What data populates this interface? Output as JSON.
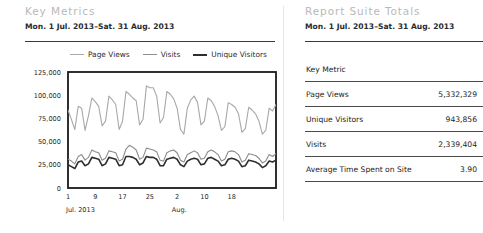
{
  "left_panel": {
    "title": "Key Metrics",
    "subtitle": "Mon. 1 Jul. 2013–Sat. 31 Aug. 2013"
  },
  "right_panel": {
    "title": "Report Suite Totals",
    "subtitle": "Mon. 1 Jul. 2013–Sat. 31 Aug. 2013",
    "table": {
      "columns": [
        "Key Metric",
        ""
      ],
      "rows": [
        {
          "metric": "Page Views",
          "value": "5,332,329"
        },
        {
          "metric": "Unique Visitors",
          "value": "943,856"
        },
        {
          "metric": "Visits",
          "value": "2,339,404"
        },
        {
          "metric": "Average Time Spent on Site",
          "value": "3.90"
        }
      ]
    }
  },
  "legend": {
    "items": [
      {
        "label": "Page Views",
        "color": "#a8a8a8"
      },
      {
        "label": "Visits",
        "color": "#8c8c8c"
      },
      {
        "label": "Unique Visitors",
        "color": "#2e2e2e"
      }
    ]
  },
  "chart_data": {
    "type": "line",
    "title": "",
    "xlabel": "",
    "ylabel": "",
    "ylim": [
      0,
      125000
    ],
    "grid": false,
    "legend_position": "top",
    "ytick_labels": [
      "125,000",
      "100,000",
      "75,000",
      "50,000",
      "25,000",
      "0"
    ],
    "ytick_values": [
      125000,
      100000,
      75000,
      50000,
      25000,
      0
    ],
    "xtick_labels": [
      "1",
      "9",
      "17",
      "25",
      "2",
      "10",
      "18"
    ],
    "xtick_indices": [
      0,
      8,
      16,
      24,
      32,
      40,
      48
    ],
    "period_labels": [
      {
        "label": "Jul. 2013",
        "index": 0
      },
      {
        "label": "Aug.",
        "index": 31
      }
    ],
    "x": [
      1,
      2,
      3,
      4,
      5,
      6,
      7,
      8,
      9,
      10,
      11,
      12,
      13,
      14,
      15,
      16,
      17,
      18,
      19,
      20,
      21,
      22,
      23,
      24,
      25,
      26,
      27,
      28,
      29,
      30,
      31,
      32,
      33,
      34,
      35,
      36,
      37,
      38,
      39,
      40,
      41,
      42,
      43,
      44,
      45,
      46,
      47,
      48,
      49,
      50,
      51,
      52,
      53,
      54,
      55,
      56,
      57,
      58,
      59,
      60,
      61,
      62
    ],
    "series": [
      {
        "name": "Page Views",
        "color": "#a8a8a8",
        "width": 1.1,
        "values": [
          84000,
          74000,
          63000,
          88000,
          86000,
          62000,
          78000,
          97000,
          93000,
          88000,
          67000,
          72000,
          99000,
          95000,
          90000,
          63000,
          72000,
          104000,
          101000,
          97000,
          94000,
          68000,
          74000,
          110000,
          108000,
          108000,
          99000,
          70000,
          76000,
          104000,
          101000,
          96000,
          86000,
          63000,
          58000,
          86000,
          95000,
          99000,
          92000,
          68000,
          72000,
          97000,
          94000,
          88000,
          78000,
          62000,
          66000,
          92000,
          90000,
          87000,
          80000,
          60000,
          64000,
          87000,
          84000,
          80000,
          72000,
          58000,
          62000,
          86000,
          83000,
          90000
        ]
      },
      {
        "name": "Visits",
        "color": "#8c8c8c",
        "width": 1.1,
        "values": [
          31000,
          29000,
          26000,
          34000,
          36000,
          30000,
          33000,
          41000,
          39000,
          38000,
          30000,
          32000,
          40000,
          39000,
          38000,
          29000,
          31000,
          42000,
          46000,
          44000,
          41000,
          31000,
          33000,
          43000,
          42000,
          41000,
          39000,
          30000,
          29000,
          38000,
          40000,
          41000,
          38000,
          30000,
          28000,
          36000,
          38000,
          40000,
          38000,
          31000,
          32000,
          39000,
          41000,
          39000,
          36000,
          29000,
          31000,
          39000,
          40000,
          39000,
          36000,
          28000,
          30000,
          37000,
          36000,
          35000,
          32000,
          27000,
          29000,
          36000,
          34000,
          37000
        ]
      },
      {
        "name": "Unique Visitors",
        "color": "#2e2e2e",
        "width": 1.6,
        "values": [
          25000,
          23000,
          21000,
          28000,
          29000,
          24000,
          26000,
          33000,
          32000,
          31000,
          24000,
          26000,
          33000,
          32000,
          31000,
          24000,
          25000,
          34000,
          34000,
          33000,
          31000,
          25000,
          27000,
          34000,
          33000,
          33000,
          31000,
          24000,
          24000,
          31000,
          32000,
          33000,
          31000,
          25000,
          23000,
          29000,
          31000,
          32000,
          31000,
          25000,
          26000,
          32000,
          33000,
          31000,
          29000,
          24000,
          25000,
          31000,
          32000,
          31000,
          29000,
          23000,
          24000,
          30000,
          29000,
          28000,
          26000,
          22000,
          24000,
          29000,
          28000,
          30000
        ]
      }
    ]
  }
}
